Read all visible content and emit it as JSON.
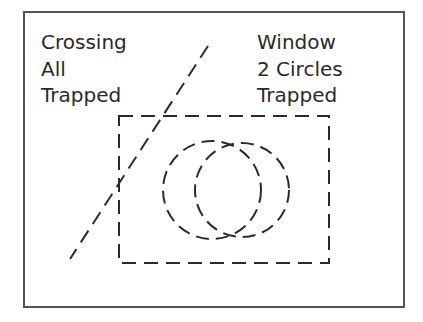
{
  "diagram": {
    "crossing_label": {
      "lines": [
        "Crossing",
        "All",
        "Trapped"
      ]
    },
    "window_label": {
      "lines": [
        "Window",
        "2 Circles",
        "Trapped"
      ]
    },
    "colors": {
      "stroke": "#2a2a2a",
      "frame": "#555555",
      "background": "#ffffff"
    }
  }
}
